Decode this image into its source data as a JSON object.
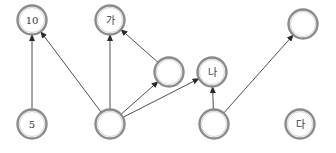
{
  "diagram": {
    "type": "directed-graph",
    "colors": {
      "node_stroke": "#8a8a8a",
      "node_fill": "#ffffff",
      "edge": "#3a3a3a",
      "text": "#333333"
    },
    "nodes": [
      {
        "id": "n10",
        "label": "10",
        "cx": 32,
        "cy": 20
      },
      {
        "id": "nga",
        "label": "가",
        "cx": 110,
        "cy": 20
      },
      {
        "id": "ntr",
        "label": "",
        "cx": 303,
        "cy": 24
      },
      {
        "id": "nmid",
        "label": "",
        "cx": 169,
        "cy": 72
      },
      {
        "id": "nna",
        "label": "나",
        "cx": 212,
        "cy": 72
      },
      {
        "id": "n5",
        "label": "5",
        "cx": 32,
        "cy": 124
      },
      {
        "id": "nbc",
        "label": "",
        "cx": 110,
        "cy": 124
      },
      {
        "id": "nbr",
        "label": "",
        "cx": 214,
        "cy": 124
      },
      {
        "id": "nda",
        "label": "다",
        "cx": 300,
        "cy": 124
      }
    ],
    "edges": [
      {
        "from": "n5",
        "to": "n10"
      },
      {
        "from": "nbc",
        "to": "n10"
      },
      {
        "from": "nbc",
        "to": "nga"
      },
      {
        "from": "nbc",
        "to": "nmid"
      },
      {
        "from": "nbc",
        "to": "nna"
      },
      {
        "from": "nmid",
        "to": "nga"
      },
      {
        "from": "nbr",
        "to": "nna"
      },
      {
        "from": "nbr",
        "to": "ntr"
      }
    ]
  }
}
